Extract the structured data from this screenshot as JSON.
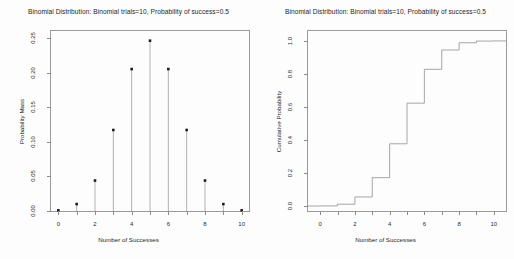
{
  "figure": {
    "background": "#fdfdfd",
    "axis_color": "#9a9a9a",
    "stem_color": "#8f8f8f",
    "marker_color": "#1a1a1a",
    "step_color": "#8f8f8f",
    "text_color": "#1d1d1d"
  },
  "panels": {
    "left": {
      "title": "Binomial Distribution:  Binomial trials=10, Probability of success=0.5",
      "xlabel": "Number of Successes",
      "ylabel": "Probability Mass"
    },
    "right": {
      "title": "Binomial Distribution:  Binomial trials=10, Probability of success=0.5",
      "xlabel": "Number of Successes",
      "ylabel": "Cumulative Probability"
    }
  },
  "chart_data": [
    {
      "type": "bar",
      "render": "stem",
      "title": "Binomial Distribution:  Binomial trials=10, Probability of success=0.5",
      "xlabel": "Number of Successes",
      "ylabel": "Probability Mass",
      "categories": [
        0,
        1,
        2,
        3,
        4,
        5,
        6,
        7,
        8,
        9,
        10
      ],
      "values": [
        0.001,
        0.01,
        0.044,
        0.117,
        0.205,
        0.246,
        0.205,
        0.117,
        0.044,
        0.01,
        0.001
      ],
      "xlim": [
        -0.4,
        10.4
      ],
      "ylim": [
        0.0,
        0.26
      ],
      "xticks": [
        0,
        2,
        4,
        6,
        8,
        10
      ],
      "xtick_labels": [
        "0",
        "2",
        "4",
        "6",
        "8",
        "10"
      ],
      "xminorticks": [
        0,
        1,
        2,
        3,
        4,
        5,
        6,
        7,
        8,
        9,
        10
      ],
      "yticks": [
        0.0,
        0.05,
        0.1,
        0.15,
        0.2,
        0.25
      ],
      "ytick_labels": [
        "0.00",
        "0.05",
        "0.10",
        "0.15",
        "0.20",
        "0.25"
      ],
      "grid": false,
      "legend": "none"
    },
    {
      "type": "line",
      "render": "step",
      "title": "Binomial Distribution:  Binomial trials=10, Probability of success=0.5",
      "xlabel": "Number of Successes",
      "ylabel": "Cumulative Probability",
      "x": [
        0,
        1,
        2,
        3,
        4,
        5,
        6,
        7,
        8,
        9,
        10
      ],
      "values": [
        0.001,
        0.011,
        0.055,
        0.172,
        0.377,
        0.623,
        0.828,
        0.945,
        0.989,
        0.999,
        1.0
      ],
      "xlim": [
        -0.7,
        10.7
      ],
      "ylim": [
        -0.03,
        1.06
      ],
      "xticks": [
        0,
        2,
        4,
        6,
        8,
        10
      ],
      "xtick_labels": [
        "0",
        "2",
        "4",
        "6",
        "8",
        "10"
      ],
      "xminorticks": [
        0,
        1,
        2,
        3,
        4,
        5,
        6,
        7,
        8,
        9,
        10
      ],
      "yticks": [
        0.0,
        0.2,
        0.4,
        0.6,
        0.8,
        1.0
      ],
      "ytick_labels": [
        "0.0",
        "0.2",
        "0.4",
        "0.6",
        "0.8",
        "1.0"
      ],
      "grid": false,
      "legend": "none"
    }
  ]
}
